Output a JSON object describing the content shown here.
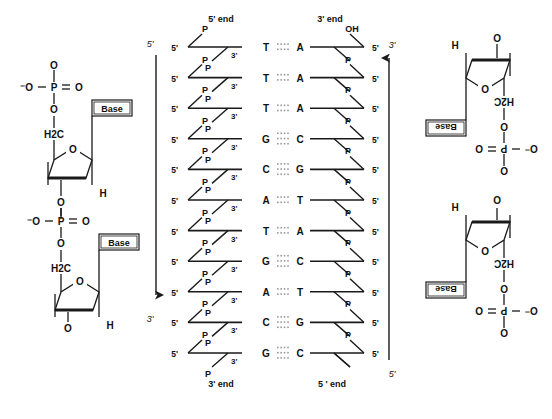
{
  "figure": {
    "stroke_color": "#1a1a1a",
    "dot_color": "#9a9a9a",
    "background": "#ffffff"
  },
  "left_structure": {
    "name": "deoxyribonucleotide-chain-upper-left",
    "top_phosphate": {
      "o_top": "O",
      "o_left": "⁻O",
      "p": "P",
      "o_right": "O",
      "o_bottom": "O"
    },
    "ch2_label": "H2C",
    "ring_o_label": "O",
    "base_label": "Base",
    "h_label": "H",
    "mid_phosphate": {
      "o_top": "O",
      "o_left": "⁻O",
      "p": "P",
      "o_right": "O",
      "o_bottom": "O"
    },
    "lower_ch2_label": "H2C",
    "lower_ring_o_label": "O",
    "lower_base_label": "Base",
    "lower_h_label": "H",
    "lower_o_label": "O"
  },
  "right_structure": {
    "name": "deoxyribonucleotide-chain-upper-right-rotated",
    "h_label": "H",
    "o_label": "O",
    "ring_o_label": "O",
    "ch2_label": "H2C",
    "base_label": "Base",
    "phosphate": {
      "o_top": "O",
      "o_left": "O",
      "p": "P",
      "o_right": "O⁻",
      "o_bottom": "O"
    },
    "lower_h_label": "H",
    "lower_o_label": "O",
    "lower_ring_o_label": "O",
    "lower_ch2_label": "H2C",
    "lower_base_label": "Base",
    "lower_phosphate": {
      "o_top": "O",
      "o_left": "O",
      "p": "P",
      "o_right": "O⁻",
      "o_bottom": "O"
    }
  },
  "ladder": {
    "top_left_label": "5' end",
    "top_right_label": "3' end",
    "bottom_left_label": "3' end",
    "bottom_right_label": "5 ' end",
    "left_strand_end_prime": "5'",
    "left_strand_junction_prime": "3'",
    "right_strand_end_prime": "5'",
    "phosphate_label": "P",
    "hydroxyl_label": "OH",
    "rows": [
      {
        "left_base": "T",
        "right_base": "A",
        "bonds": 2
      },
      {
        "left_base": "T",
        "right_base": "A",
        "bonds": 2
      },
      {
        "left_base": "T",
        "right_base": "A",
        "bonds": 2
      },
      {
        "left_base": "G",
        "right_base": "C",
        "bonds": 3
      },
      {
        "left_base": "C",
        "right_base": "G",
        "bonds": 3
      },
      {
        "left_base": "A",
        "right_base": "T",
        "bonds": 2
      },
      {
        "left_base": "T",
        "right_base": "A",
        "bonds": 2
      },
      {
        "left_base": "G",
        "right_base": "C",
        "bonds": 3
      },
      {
        "left_base": "A",
        "right_base": "T",
        "bonds": 2
      },
      {
        "left_base": "C",
        "right_base": "G",
        "bonds": 3
      },
      {
        "left_base": "G",
        "right_base": "C",
        "bonds": 3
      }
    ]
  },
  "arrows": {
    "left": {
      "top_label": "5'",
      "bottom_label": "3'",
      "direction": "down"
    },
    "right": {
      "top_label": "3'",
      "bottom_label": "5'",
      "direction": "up"
    }
  }
}
